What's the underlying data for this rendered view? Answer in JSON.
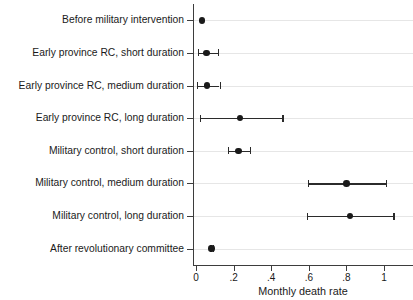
{
  "chart_data": {
    "type": "scatter",
    "title": "",
    "subtitle": "",
    "xlabel": "Monthly death rate",
    "ylabel": "",
    "xlim": [
      0,
      1.07
    ],
    "xticks": [
      0,
      0.2,
      0.4,
      0.6,
      0.8,
      1
    ],
    "xticklabels": [
      "0",
      ".2",
      ".4",
      ".6",
      ".8",
      "1"
    ],
    "grid": "horizontal",
    "legend": "none",
    "orientation": "horizontal",
    "marker": "filled-circle",
    "error_bars": "95% confidence interval (capped whiskers)",
    "categories": [
      "Before military intervention",
      "Early province RC, short duration",
      "Early province RC, medium duration",
      "Early province RC, long duration",
      "Military control, short duration",
      "Military control, medium duration",
      "Military control, long duration",
      "After revolutionary committee"
    ],
    "values": [
      0.032,
      0.055,
      0.058,
      0.235,
      0.225,
      0.8,
      0.82,
      0.082
    ],
    "ci_low": [
      0.032,
      0.01,
      0.005,
      0.02,
      0.17,
      0.595,
      0.59,
      0.072
    ],
    "ci_high": [
      0.032,
      0.115,
      0.125,
      0.46,
      0.285,
      1.01,
      1.05,
      0.092
    ],
    "points": [
      {
        "label": "Before military intervention",
        "value": 0.032,
        "ci_low": 0.032,
        "ci_high": 0.032
      },
      {
        "label": "Early province RC, short duration",
        "value": 0.055,
        "ci_low": 0.01,
        "ci_high": 0.115
      },
      {
        "label": "Early province RC, medium duration",
        "value": 0.058,
        "ci_low": 0.005,
        "ci_high": 0.125
      },
      {
        "label": "Early province RC, long duration",
        "value": 0.235,
        "ci_low": 0.02,
        "ci_high": 0.46
      },
      {
        "label": "Military control, short duration",
        "value": 0.225,
        "ci_low": 0.17,
        "ci_high": 0.285
      },
      {
        "label": "Military control, medium duration",
        "value": 0.8,
        "ci_low": 0.595,
        "ci_high": 1.01
      },
      {
        "label": "Military control, long duration",
        "value": 0.82,
        "ci_low": 0.59,
        "ci_high": 1.05
      },
      {
        "label": "After revolutionary committee",
        "value": 0.082,
        "ci_low": 0.072,
        "ci_high": 0.092
      }
    ],
    "colors": {
      "background": "#ffffff",
      "marker": "#1a1a1a",
      "error_bar": "#2b2b2b",
      "gridline": "#e6e6e6",
      "axis": "#3d3d3d",
      "text": "#1a1a1a"
    }
  }
}
